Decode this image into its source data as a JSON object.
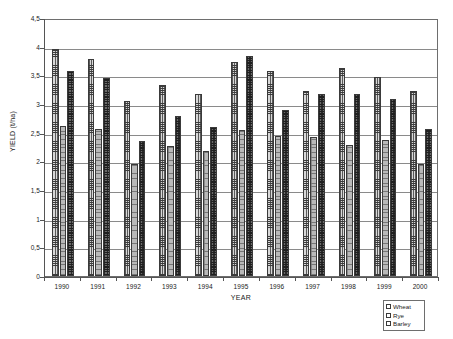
{
  "chart_data": {
    "type": "bar",
    "title": "",
    "xlabel": "YEAR",
    "ylabel": "YIELD (t/ha)",
    "ylim": [
      0,
      4.5
    ],
    "ytick_step": 0.5,
    "grid": true,
    "decimal_separator": ",",
    "legend_position": "bottom-right",
    "categories": [
      "1990",
      "1991",
      "1992",
      "1993",
      "1994",
      "1995",
      "1996",
      "1997",
      "1998",
      "1999",
      "2000"
    ],
    "ytick_labels": [
      "0",
      "0,5",
      "1",
      "1,5",
      "2",
      "2,5",
      "3",
      "3,5",
      "4",
      "4,5"
    ],
    "ytick_values": [
      0,
      0.5,
      1,
      1.5,
      2,
      2.5,
      3,
      3.5,
      4,
      4.5
    ],
    "series": [
      {
        "name": "Wheat",
        "pattern": "fine-grid-light",
        "values": [
          3.96,
          3.79,
          3.06,
          3.33,
          3.18,
          3.73,
          3.57,
          3.23,
          3.62,
          3.47,
          3.22
        ]
      },
      {
        "name": "Rye",
        "pattern": "sparse-dot-light",
        "values": [
          2.62,
          2.57,
          1.95,
          2.27,
          2.18,
          2.55,
          2.45,
          2.42,
          2.29,
          2.37,
          1.95
        ]
      },
      {
        "name": "Barley",
        "pattern": "dense-checker-dark",
        "values": [
          3.58,
          3.45,
          2.36,
          2.79,
          2.6,
          3.84,
          2.9,
          3.18,
          3.18,
          3.08,
          2.57
        ]
      }
    ]
  }
}
